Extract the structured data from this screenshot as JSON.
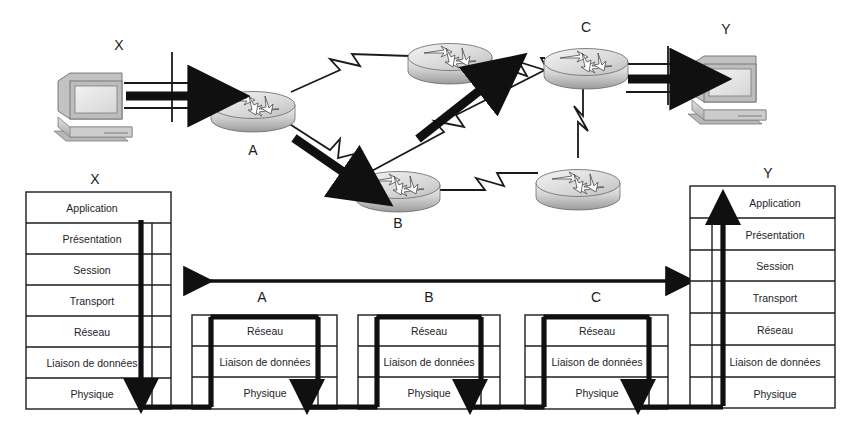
{
  "topology": {
    "hosts": [
      {
        "id": "host-x",
        "label": "X",
        "icon": "desktop-computer-icon",
        "x": 88,
        "y": 105
      },
      {
        "id": "host-y",
        "label": "Y",
        "icon": "desktop-computer-icon",
        "x": 722,
        "y": 88
      }
    ],
    "routers": [
      {
        "id": "router-a",
        "label": "A",
        "icon": "router-icon",
        "x": 253,
        "y": 105,
        "label_x": 253,
        "label_y": 155
      },
      {
        "id": "router-top",
        "label": "",
        "icon": "router-icon",
        "x": 450,
        "y": 57,
        "label_x": 450,
        "label_y": 30
      },
      {
        "id": "router-c",
        "label": "C",
        "icon": "router-icon",
        "x": 586,
        "y": 62,
        "label_x": 586,
        "label_y": 32
      },
      {
        "id": "router-b",
        "label": "B",
        "icon": "router-icon",
        "x": 398,
        "y": 185,
        "label_x": 398,
        "label_y": 228
      },
      {
        "id": "router-lower-right",
        "label": "",
        "icon": "router-icon",
        "x": 578,
        "y": 183,
        "label_x": 578,
        "label_y": 225
      }
    ],
    "flow_arrows": [
      {
        "name": "flow-x-to-a",
        "desc": "thick arrow from host X into router A"
      },
      {
        "name": "flow-a-to-b",
        "desc": "thick arrow from router A down to router B"
      },
      {
        "name": "flow-b-to-c",
        "desc": "thick arrow from router B up to router C"
      },
      {
        "name": "flow-c-to-y",
        "desc": "thick arrow from router C to host Y"
      }
    ]
  },
  "stacks": {
    "x": {
      "title": "X",
      "layers": [
        "Application",
        "Présentation",
        "Session",
        "Transport",
        "Réseau",
        "Liaison de données",
        "Physique"
      ],
      "arrow_direction": "down"
    },
    "y": {
      "title": "Y",
      "layers": [
        "Application",
        "Présentation",
        "Session",
        "Transport",
        "Réseau",
        "Liaison de données",
        "Physique"
      ],
      "arrow_direction": "up"
    },
    "routers": [
      {
        "title": "A",
        "layers": [
          "Réseau",
          "Liaison de données",
          "Physique"
        ],
        "arrow_direction": "down"
      },
      {
        "title": "B",
        "layers": [
          "Réseau",
          "Liaison de données",
          "Physique"
        ],
        "arrow_direction": "down"
      },
      {
        "title": "C",
        "layers": [
          "Réseau",
          "Liaison de données",
          "Physique"
        ],
        "arrow_direction": "down"
      }
    ]
  },
  "span_arrow": {
    "name": "bidirectional-span-arrow",
    "direction": "both"
  },
  "colors": {
    "ink": "#1a1a1a",
    "background": "#ffffff",
    "device_body": "#c9c9c9",
    "device_light": "#e8e8e8",
    "device_dark": "#8e8e8e"
  }
}
